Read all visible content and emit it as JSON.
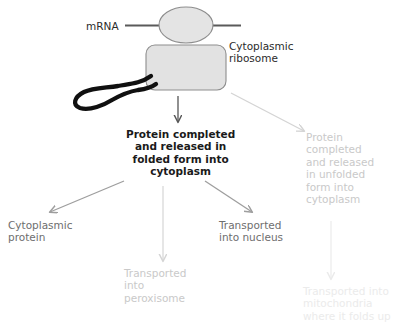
{
  "diagram": {
    "title_present": false,
    "background_color": "#ffffff",
    "colors": {
      "dark_text": "#2b2b2b",
      "mid_gray_text": "#6e6e6e",
      "faint_gray_text": "#c9c9c9",
      "ghost_gray_text": "#ebebeb",
      "ribosome_fill": "#e2e2e2",
      "ribosome_stroke": "#8a8a8a",
      "mrna_line": "#5a5a5a",
      "protein_chain": "#101010",
      "dark_arrow": "#555555",
      "mid_arrow": "#9e9e9e",
      "faint_arrow": "#d9d9d9",
      "ghost_arrow": "#ededed"
    },
    "shapes": {
      "small_subunit": {
        "name": "ribosome-small-subunit",
        "type": "ellipse"
      },
      "large_subunit": {
        "name": "ribosome-large-subunit",
        "type": "rounded-rect"
      },
      "mrna_strand": {
        "name": "mrna-strand",
        "type": "line"
      },
      "protein_chain": {
        "name": "nascent-protein-chain",
        "type": "folded-curve"
      }
    },
    "labels": {
      "mrna": "mRNA",
      "cytoplasmic_ribosome": "Cytoplasmic\nribosome",
      "protein_folded": "Protein completed\nand released in\nfolded form into\ncytoplasm",
      "protein_unfolded": "Protein\ncompleted\nand released\nin unfolded\nform into\ncytoplasm",
      "cytoplasmic_protein": "Cytoplasmic\nprotein",
      "transported_nucleus": "Transported\ninto nucleus",
      "transported_peroxisome": "Transported\ninto\nperoxisome",
      "transported_mitochondria": "Transported into\nmitochondria\nwhere it folds up"
    },
    "arrows": [
      {
        "name": "arrow-ribosome-to-folded",
        "from": "cytoplasmic-ribosome",
        "to": "protein-folded",
        "direction": "down",
        "style": "dark"
      },
      {
        "name": "arrow-ribosome-to-unfolded",
        "from": "cytoplasmic-ribosome",
        "to": "protein-unfolded",
        "direction": "down-right",
        "style": "faint"
      },
      {
        "name": "arrow-folded-to-cytoplasmic-protein",
        "from": "protein-folded",
        "to": "cytoplasmic-protein",
        "direction": "down-left",
        "style": "mid"
      },
      {
        "name": "arrow-folded-to-nucleus",
        "from": "protein-folded",
        "to": "transported-nucleus",
        "direction": "down-right",
        "style": "mid"
      },
      {
        "name": "arrow-folded-to-peroxisome",
        "from": "protein-folded",
        "to": "transported-peroxisome",
        "direction": "down",
        "style": "faint"
      },
      {
        "name": "arrow-unfolded-to-mitochondria",
        "from": "protein-unfolded",
        "to": "transported-mitochondria",
        "direction": "down",
        "style": "ghost"
      }
    ]
  }
}
